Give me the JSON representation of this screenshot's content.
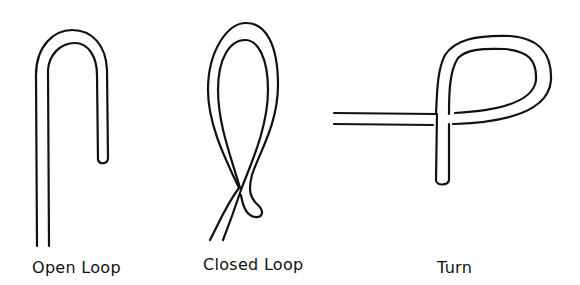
{
  "figures": [
    {
      "id": "open-loop",
      "label": "Open Loop"
    },
    {
      "id": "closed-loop",
      "label": "Closed Loop"
    },
    {
      "id": "turn",
      "label": "Turn"
    }
  ],
  "colors": {
    "stroke": "#111111",
    "background": "#ffffff"
  }
}
